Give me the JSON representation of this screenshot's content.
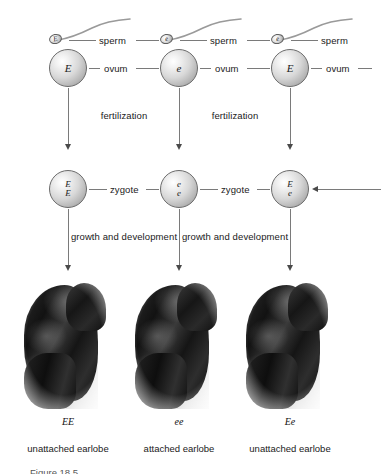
{
  "diagram": {
    "background_color": "#ffffff",
    "line_color": "#7a7a7a",
    "arrow_color": "#4a4a4a",
    "columns": [
      {
        "id": "column-1",
        "sperm_allele": "E",
        "ovum_allele": "E",
        "zygote_alleles": [
          "E",
          "E"
        ],
        "genotype": "EE",
        "phenotype": "unattached earlobe"
      },
      {
        "id": "column-2",
        "sperm_allele": "e",
        "ovum_allele": "e",
        "zygote_alleles": [
          "e",
          "e"
        ],
        "genotype": "ee",
        "phenotype": "attached earlobe"
      },
      {
        "id": "column-3",
        "sperm_allele": "e",
        "ovum_allele": "E",
        "zygote_alleles": [
          "E",
          "e"
        ],
        "genotype": "Ee",
        "phenotype": "unattached earlobe"
      }
    ],
    "labels": {
      "sperm": "sperm",
      "ovum": "ovum",
      "zygote": "zygote",
      "fertilization": "fertilization",
      "growth": "growth and development"
    },
    "figure_caption": "Figure 18.5"
  }
}
